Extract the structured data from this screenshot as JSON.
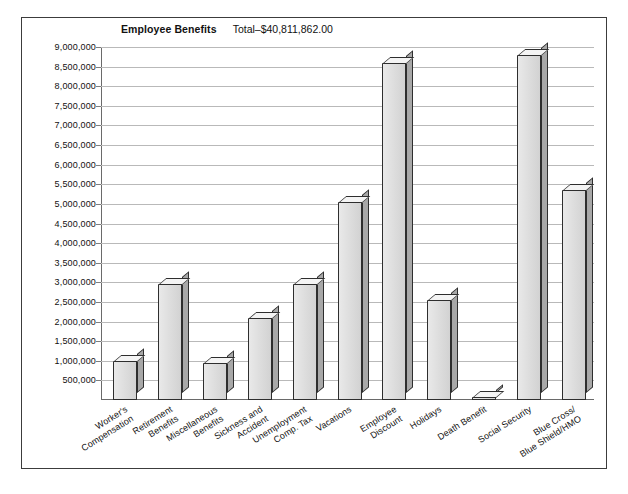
{
  "chart_data": {
    "type": "bar",
    "title": "Employee Benefits",
    "total_label": "Total–$40,811,862.00",
    "xlabel": "",
    "ylabel": "",
    "ylim": [
      0,
      9000000
    ],
    "grid": true,
    "legend": "none",
    "ytick_labels": [
      "9,000,000",
      "8,500,000",
      "8,000,000",
      "7,500,000",
      "7,000,000",
      "6,500,000",
      "6,000,000",
      "5,500,000",
      "5,000,000",
      "4,500,000",
      "4,000,000",
      "3,500,000",
      "3,000,000",
      "2,500,000",
      "2,000,000",
      "1,500,000",
      "1,000,000",
      "500,000"
    ],
    "ytick_values": [
      9000000,
      8500000,
      8000000,
      7500000,
      7000000,
      6500000,
      6000000,
      5500000,
      5000000,
      4500000,
      4000000,
      3500000,
      3000000,
      2500000,
      2000000,
      1500000,
      1000000,
      500000
    ],
    "categories": [
      "Worker's Compensation",
      "Retirement Benefits",
      "Miscellaneous Benefits",
      "Sickness and Accident",
      "Unemployment Comp. Tax",
      "Vacations",
      "Employee Discount",
      "Holidays",
      "Death Benefit",
      "Social Security",
      "Blue Cross/Blue Shield/HMO"
    ],
    "category_lines": [
      [
        "Worker's",
        "Compensation"
      ],
      [
        "Retirement",
        "Benefits"
      ],
      [
        "Miscellaneous",
        "Benefits"
      ],
      [
        "Sickness and",
        "Accident"
      ],
      [
        "Unemployment",
        "Comp. Tax"
      ],
      [
        "Vacations"
      ],
      [
        "Employee",
        "Discount"
      ],
      [
        "Holidays"
      ],
      [
        "Death Benefit"
      ],
      [
        "Social Security"
      ],
      [
        "Blue Cross/",
        "Blue Shield/HMO"
      ]
    ],
    "values": [
      1000000,
      2950000,
      950000,
      2100000,
      2950000,
      5050000,
      8600000,
      2550000,
      70000,
      8800000,
      5350000
    ],
    "colors": {
      "bar_front": "#dcdcdc",
      "bar_side": "#a8a8a8",
      "bar_top": "#f4f4f4",
      "bar_outline": "#2e2e2e",
      "gridline": "#b9b9b9",
      "axis": "#6a6a6a",
      "panel_border": "#3c3c3c",
      "text": "#111111",
      "background": "#ffffff"
    }
  }
}
